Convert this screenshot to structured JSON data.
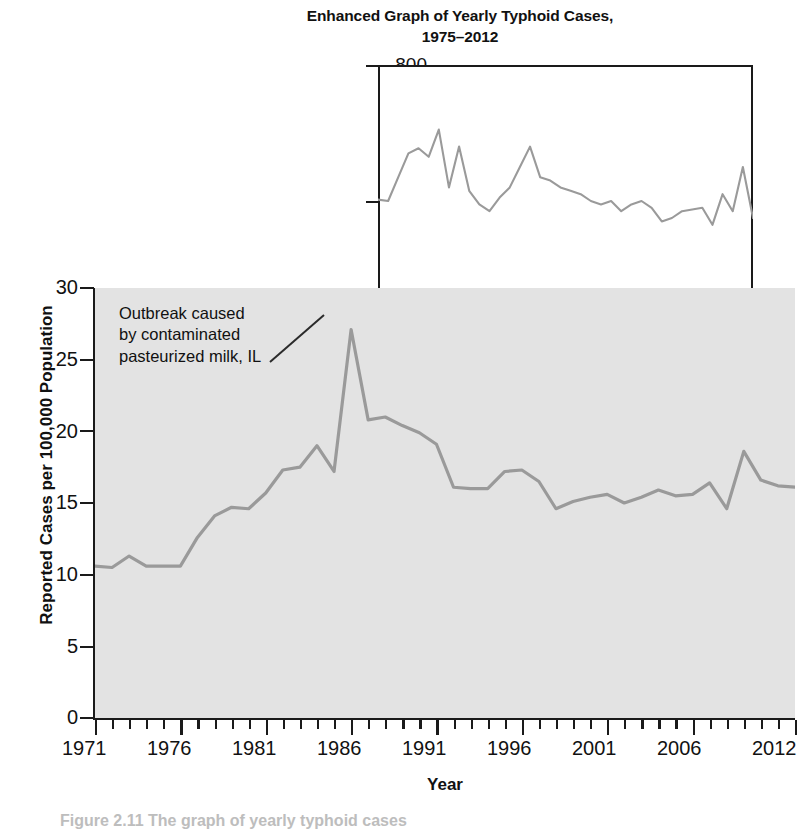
{
  "inset": {
    "title": "Enhanced Graph of Yearly Typhoid Cases, 1975–2012",
    "title_line1": "Enhanced Graph of Yearly Typhoid Cases,",
    "title_line2": "1975–2012",
    "xaxis_title": "Year",
    "ytick_800": "800",
    "ytick_400": "400",
    "ytick_0": "0",
    "xtick_1975": "1975",
    "xtick_1987": "1987",
    "xtick_1997": "1997",
    "xtick_2007": "2007",
    "xtick_2012": "2012"
  },
  "main": {
    "yaxis_title": "Reported Cases per 100,000 Population",
    "xaxis_title": "Year",
    "ytick_0": "0",
    "ytick_5": "5",
    "ytick_10": "10",
    "ytick_15": "15",
    "ytick_20": "20",
    "ytick_25": "25",
    "ytick_30": "30",
    "xtick_1971": "1971",
    "xtick_1976": "1976",
    "xtick_1981": "1981",
    "xtick_1986": "1986",
    "xtick_1991": "1991",
    "xtick_1996": "1996",
    "xtick_2001": "2001",
    "xtick_2006": "2006",
    "xtick_2012": "2012"
  },
  "annotation": {
    "line1": "Outbreak caused",
    "line2": "by contaminated",
    "line3": "pasteurized milk, IL"
  },
  "caption": "Figure 2.11 The graph of yearly typhoid cases",
  "colors": {
    "line": "#9a9a9a",
    "axis": "#1a1a1a",
    "plot_background": "#e3e3e3",
    "inset_background": "#ffffff",
    "text": "#111111"
  },
  "chart_data": [
    {
      "type": "line",
      "id": "main-chart",
      "title": "",
      "xlabel": "Year",
      "ylabel": "Reported Cases per 100,000 Population",
      "xlim": [
        1971,
        2012
      ],
      "ylim": [
        0,
        30
      ],
      "yticks": [
        0,
        5,
        10,
        15,
        20,
        25,
        30
      ],
      "xticks": [
        1971,
        1976,
        1981,
        1986,
        1991,
        1996,
        2001,
        2006,
        2012
      ],
      "xtick_minor_step": 1,
      "grid": false,
      "legend": null,
      "annotations": [
        {
          "text": "Outbreak caused by contaminated pasteurized milk, IL",
          "points_to_x": 1985,
          "points_to_y": 27.1
        }
      ],
      "x": [
        1971,
        1972,
        1973,
        1974,
        1975,
        1976,
        1977,
        1978,
        1979,
        1980,
        1981,
        1982,
        1983,
        1984,
        1985,
        1986,
        1987,
        1988,
        1989,
        1990,
        1991,
        1992,
        1993,
        1994,
        1995,
        1996,
        1997,
        1998,
        1999,
        2000,
        2001,
        2002,
        2003,
        2004,
        2005,
        2006,
        2007,
        2008,
        2009,
        2010,
        2011,
        2012
      ],
      "values": [
        10.6,
        10.5,
        11.3,
        10.6,
        10.6,
        10.6,
        12.6,
        14.1,
        14.7,
        14.6,
        15.7,
        17.3,
        17.5,
        19.0,
        17.2,
        27.1,
        20.8,
        21.0,
        20.4,
        19.9,
        19.1,
        16.1,
        16.0,
        16.0,
        17.2,
        17.3,
        16.5,
        14.6,
        15.1,
        15.4,
        15.6,
        15.0,
        15.4,
        15.9,
        15.5,
        15.6,
        16.4,
        14.6,
        18.6,
        16.6,
        16.2,
        16.1
      ]
    },
    {
      "type": "line",
      "id": "inset-chart",
      "title": "Enhanced Graph of Yearly Typhoid Cases, 1975–2012",
      "xlabel": "Year",
      "ylabel": "",
      "xlim": [
        1975,
        2012
      ],
      "ylim": [
        0,
        800
      ],
      "yticks": [
        0,
        400,
        800
      ],
      "xticks": [
        1975,
        1987,
        1997,
        2007,
        2012
      ],
      "xtick_minor_step": 1,
      "grid": false,
      "legend": null,
      "x": [
        1975,
        1976,
        1977,
        1978,
        1979,
        1980,
        1981,
        1982,
        1983,
        1984,
        1985,
        1986,
        1987,
        1988,
        1989,
        1990,
        1991,
        1992,
        1993,
        1994,
        1995,
        1996,
        1997,
        1998,
        1999,
        2000,
        2001,
        2002,
        2003,
        2004,
        2005,
        2006,
        2007,
        2008,
        2009,
        2010,
        2011,
        2012
      ],
      "values": [
        404,
        400,
        470,
        540,
        555,
        530,
        610,
        440,
        560,
        430,
        390,
        370,
        410,
        440,
        500,
        560,
        470,
        460,
        440,
        430,
        420,
        400,
        390,
        400,
        370,
        390,
        400,
        380,
        340,
        350,
        370,
        375,
        380,
        330,
        420,
        370,
        500,
        350
      ]
    }
  ]
}
